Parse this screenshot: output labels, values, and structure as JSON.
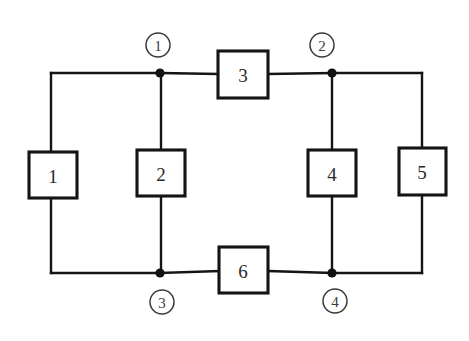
{
  "diagram": {
    "type": "circuit-schematic",
    "background_color": "#ffffff",
    "wire_color": "#151515",
    "box_border_color": "#141414",
    "box_fill_color": "#ffffff",
    "label_color": "#2a2a2a",
    "node_marker_color": "#3a3a3a"
  },
  "components": [
    {
      "id": "branch-1",
      "label": "1",
      "orientation": "vertical",
      "x": 29,
      "y": 152,
      "width": 48,
      "height": 46,
      "center_x": 53,
      "center_y": 175
    },
    {
      "id": "branch-2",
      "label": "2",
      "orientation": "vertical",
      "x": 137,
      "y": 150,
      "width": 48,
      "height": 46,
      "center_x": 161,
      "center_y": 173
    },
    {
      "id": "branch-3",
      "label": "3",
      "orientation": "horizontal",
      "x": 218,
      "y": 51,
      "width": 50,
      "height": 47,
      "center_x": 243,
      "center_y": 74
    },
    {
      "id": "branch-4",
      "label": "4",
      "orientation": "vertical",
      "x": 308,
      "y": 150,
      "width": 48,
      "height": 46,
      "center_x": 332,
      "center_y": 173
    },
    {
      "id": "branch-5",
      "label": "5",
      "orientation": "vertical",
      "x": 399,
      "y": 148,
      "width": 47,
      "height": 47,
      "center_x": 422,
      "center_y": 171
    },
    {
      "id": "branch-6",
      "label": "6",
      "orientation": "horizontal",
      "x": 219,
      "y": 247,
      "width": 49,
      "height": 46,
      "center_x": 243,
      "center_y": 270
    }
  ],
  "nodes": [
    {
      "id": "node-1",
      "label": "1",
      "circle_x": 158,
      "circle_y": 45,
      "radius": 12,
      "junction_x": 160,
      "junction_y": 73
    },
    {
      "id": "node-2",
      "label": "2",
      "circle_x": 322,
      "circle_y": 45,
      "radius": 12,
      "junction_x": 332,
      "junction_y": 73
    },
    {
      "id": "node-3",
      "label": "3",
      "circle_x": 162,
      "circle_y": 302,
      "radius": 12,
      "junction_x": 160,
      "junction_y": 273
    },
    {
      "id": "node-4",
      "label": "4",
      "circle_x": 335,
      "circle_y": 301,
      "radius": 12,
      "junction_x": 332,
      "junction_y": 273
    }
  ],
  "wires": [
    {
      "id": "wire-top-left",
      "d": "M 51,73 L 160,73"
    },
    {
      "id": "wire-node1-to-box3",
      "d": "M 160,73 L 218,74"
    },
    {
      "id": "wire-box3-to-node2",
      "d": "M 268,74 L 332,73"
    },
    {
      "id": "wire-node2-to-right-corner",
      "d": "M 332,73 L 422,73"
    },
    {
      "id": "wire-left-vertical-upper",
      "d": "M 51,73 L 51,152"
    },
    {
      "id": "wire-left-vertical-lower",
      "d": "M 51,198 L 51,273"
    },
    {
      "id": "wire-branch2-upper",
      "d": "M 161,73 L 161,150"
    },
    {
      "id": "wire-branch2-lower",
      "d": "M 161,196 L 161,273"
    },
    {
      "id": "wire-branch4-upper",
      "d": "M 332,73 L 332,150"
    },
    {
      "id": "wire-branch4-lower",
      "d": "M 332,196 L 332,273"
    },
    {
      "id": "wire-right-vertical-upper",
      "d": "M 422,73 L 422,148"
    },
    {
      "id": "wire-right-vertical-lower",
      "d": "M 422,195 L 422,273"
    },
    {
      "id": "wire-bottom-left",
      "d": "M 51,273 L 160,273"
    },
    {
      "id": "wire-node3-to-box6",
      "d": "M 160,273 L 219,271"
    },
    {
      "id": "wire-box6-to-node4",
      "d": "M 268,271 L 332,273"
    },
    {
      "id": "wire-node4-to-right-corner",
      "d": "M 332,273 L 422,273"
    }
  ]
}
